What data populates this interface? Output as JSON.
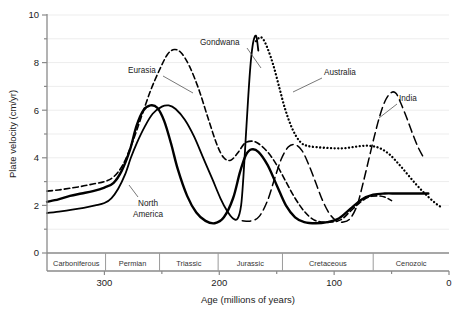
{
  "chart_data": {
    "type": "line",
    "title": "",
    "xlabel": "Age (millions of years)",
    "ylabel": "Plate velocity (cm/yr)",
    "xlim": [
      350,
      0
    ],
    "ylim": [
      0,
      10
    ],
    "x_ticks": [
      300,
      200,
      100,
      0
    ],
    "x_tick_labels": [
      "300",
      "200",
      "100",
      "0"
    ],
    "x_minor_ticks": [
      250,
      150,
      50
    ],
    "y_ticks": [
      0,
      2,
      4,
      6,
      8,
      10
    ],
    "y_tick_labels": [
      "0",
      "2",
      "4",
      "6",
      "8",
      "10"
    ],
    "y_minor_ticks": [
      1,
      3,
      5,
      7,
      9
    ],
    "grid": "horizontal-faint",
    "legend": "inline-annotations",
    "axis_direction": "x reversed (oldest at left)",
    "period_band": {
      "periods": [
        {
          "name": "Carboniferous",
          "start": 350,
          "end": 299
        },
        {
          "name": "Permian",
          "start": 299,
          "end": 252
        },
        {
          "name": "Triassic",
          "start": 252,
          "end": 201
        },
        {
          "name": "Jurassic",
          "start": 201,
          "end": 145
        },
        {
          "name": "Cretaceous",
          "start": 145,
          "end": 66
        },
        {
          "name": "Cenozoic",
          "start": 66,
          "end": 0
        }
      ]
    },
    "series": [
      {
        "name": "North America",
        "style": "thick-solid",
        "label_position": "below-left-of-first-peak",
        "points": [
          [
            350,
            2.15
          ],
          [
            340,
            2.25
          ],
          [
            330,
            2.4
          ],
          [
            320,
            2.5
          ],
          [
            310,
            2.6
          ],
          [
            300,
            2.75
          ],
          [
            292,
            2.95
          ],
          [
            285,
            3.45
          ],
          [
            278,
            4.3
          ],
          [
            272,
            5.35
          ],
          [
            266,
            6.0
          ],
          [
            260,
            6.2
          ],
          [
            254,
            6.1
          ],
          [
            248,
            5.55
          ],
          [
            242,
            4.6
          ],
          [
            236,
            3.5
          ],
          [
            228,
            2.4
          ],
          [
            220,
            1.7
          ],
          [
            212,
            1.35
          ],
          [
            204,
            1.25
          ],
          [
            196,
            1.5
          ],
          [
            188,
            2.3
          ],
          [
            182,
            3.4
          ],
          [
            177,
            4.1
          ],
          [
            172,
            4.35
          ],
          [
            166,
            4.25
          ],
          [
            158,
            3.7
          ],
          [
            150,
            2.85
          ],
          [
            142,
            2.0
          ],
          [
            134,
            1.5
          ],
          [
            126,
            1.3
          ],
          [
            116,
            1.25
          ],
          [
            106,
            1.3
          ],
          [
            96,
            1.45
          ],
          [
            86,
            1.85
          ],
          [
            76,
            2.25
          ],
          [
            66,
            2.45
          ],
          [
            56,
            2.5
          ],
          [
            46,
            2.5
          ],
          [
            36,
            2.5
          ],
          [
            26,
            2.5
          ],
          [
            18,
            2.5
          ]
        ]
      },
      {
        "name": "Eurasia",
        "style": "short-dash",
        "label_position": "upper-left",
        "points": [
          [
            350,
            2.6
          ],
          [
            340,
            2.65
          ],
          [
            330,
            2.72
          ],
          [
            320,
            2.8
          ],
          [
            310,
            2.9
          ],
          [
            300,
            3.0
          ],
          [
            292,
            3.2
          ],
          [
            284,
            3.7
          ],
          [
            276,
            4.6
          ],
          [
            268,
            5.7
          ],
          [
            260,
            6.8
          ],
          [
            252,
            7.7
          ],
          [
            245,
            8.35
          ],
          [
            239,
            8.55
          ],
          [
            233,
            8.4
          ],
          [
            226,
            7.85
          ],
          [
            218,
            6.9
          ],
          [
            210,
            5.7
          ],
          [
            202,
            4.55
          ],
          [
            196,
            4.0
          ],
          [
            190,
            3.9
          ],
          [
            184,
            4.2
          ],
          [
            178,
            4.6
          ],
          [
            172,
            4.7
          ],
          [
            166,
            4.6
          ],
          [
            158,
            4.25
          ],
          [
            150,
            3.7
          ],
          [
            142,
            3.0
          ],
          [
            134,
            2.3
          ],
          [
            126,
            1.75
          ],
          [
            118,
            1.4
          ],
          [
            110,
            1.3
          ],
          [
            102,
            1.3
          ],
          [
            94,
            1.4
          ],
          [
            86,
            1.75
          ],
          [
            78,
            2.1
          ],
          [
            70,
            2.35
          ],
          [
            62,
            2.4
          ],
          [
            56,
            2.35
          ],
          [
            50,
            2.2
          ]
        ]
      },
      {
        "name": "Gondwana",
        "style": "thin-solid-spike",
        "label_position": "top-center",
        "points": [
          [
            350,
            1.68
          ],
          [
            338,
            1.75
          ],
          [
            328,
            1.82
          ],
          [
            318,
            1.9
          ],
          [
            308,
            2.0
          ],
          [
            300,
            2.1
          ],
          [
            294,
            2.3
          ],
          [
            288,
            2.7
          ],
          [
            282,
            3.3
          ],
          [
            277,
            4.0
          ],
          [
            272,
            4.6
          ],
          [
            265,
            5.3
          ],
          [
            258,
            5.85
          ],
          [
            250,
            6.15
          ],
          [
            244,
            6.2
          ],
          [
            238,
            6.05
          ],
          [
            230,
            5.6
          ],
          [
            222,
            4.9
          ],
          [
            214,
            4.0
          ],
          [
            206,
            3.1
          ],
          [
            199,
            2.3
          ],
          [
            193,
            1.75
          ],
          [
            188,
            1.45
          ],
          [
            184,
            1.45
          ],
          [
            181,
            2.0
          ],
          [
            179,
            3.2
          ],
          [
            177,
            4.8
          ],
          [
            175,
            6.4
          ],
          [
            173,
            7.8
          ],
          [
            171,
            8.7
          ],
          [
            169,
            9.1
          ],
          [
            167.5,
            9.05
          ],
          [
            166,
            8.5
          ]
        ]
      },
      {
        "name": "Australia",
        "style": "dotted",
        "label_position": "right-of-peak",
        "points": [
          [
            168,
            8.9
          ],
          [
            165,
            9.05
          ],
          [
            162,
            9.0
          ],
          [
            158,
            8.6
          ],
          [
            153,
            7.9
          ],
          [
            148,
            7.0
          ],
          [
            143,
            6.1
          ],
          [
            138,
            5.4
          ],
          [
            133,
            4.9
          ],
          [
            128,
            4.6
          ],
          [
            123,
            4.5
          ],
          [
            116,
            4.45
          ],
          [
            108,
            4.42
          ],
          [
            100,
            4.4
          ],
          [
            92,
            4.4
          ],
          [
            84,
            4.45
          ],
          [
            76,
            4.5
          ],
          [
            68,
            4.5
          ],
          [
            60,
            4.4
          ],
          [
            52,
            4.15
          ],
          [
            44,
            3.75
          ],
          [
            36,
            3.3
          ],
          [
            28,
            2.85
          ],
          [
            20,
            2.45
          ],
          [
            12,
            2.1
          ],
          [
            6,
            1.9
          ]
        ]
      },
      {
        "name": "India",
        "style": "long-dash",
        "label_position": "right",
        "points": [
          [
            180,
            1.35
          ],
          [
            172,
            1.35
          ],
          [
            165,
            1.55
          ],
          [
            158,
            2.2
          ],
          [
            152,
            3.1
          ],
          [
            146,
            3.95
          ],
          [
            140,
            4.45
          ],
          [
            134,
            4.55
          ],
          [
            128,
            4.3
          ],
          [
            122,
            3.7
          ],
          [
            116,
            2.95
          ],
          [
            110,
            2.2
          ],
          [
            104,
            1.65
          ],
          [
            98,
            1.35
          ],
          [
            92,
            1.3
          ],
          [
            86,
            1.45
          ],
          [
            80,
            2.0
          ],
          [
            75,
            2.9
          ],
          [
            70,
            3.9
          ],
          [
            65,
            4.9
          ],
          [
            60,
            5.8
          ],
          [
            55,
            6.45
          ],
          [
            50,
            6.75
          ],
          [
            46,
            6.7
          ],
          [
            42,
            6.3
          ],
          [
            37,
            5.7
          ],
          [
            32,
            5.05
          ],
          [
            27,
            4.45
          ],
          [
            22,
            4.0
          ]
        ]
      }
    ]
  },
  "annotations": {
    "north_america_line1": "North",
    "north_america_line2": "America",
    "eurasia": "Eurasia",
    "gondwana": "Gondwana",
    "australia": "Australia",
    "india": "India"
  }
}
